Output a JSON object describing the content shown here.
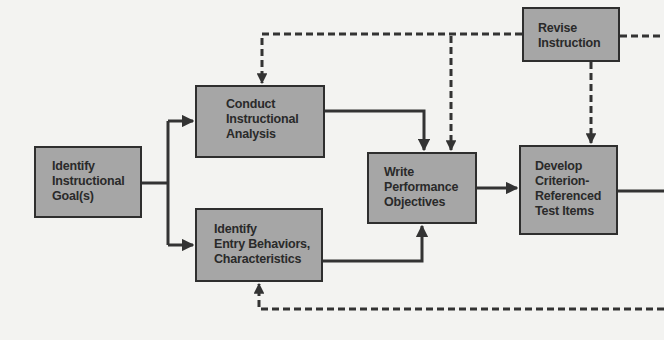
{
  "diagram": {
    "type": "flowchart",
    "colors": {
      "background": "#f3f3f1",
      "box_fill": "#a6a6a6",
      "box_border": "#2e2e2e",
      "line": "#333333",
      "text": "#2a2a2a"
    },
    "nodes": [
      {
        "id": "identify-goals",
        "label": "Identify\nInstructional\nGoal(s)"
      },
      {
        "id": "conduct-analysis",
        "label": "Conduct\nInstructional\nAnalysis"
      },
      {
        "id": "identify-entry",
        "label": "Identify\nEntry Behaviors,\nCharacteristics"
      },
      {
        "id": "write-objectives",
        "label": "Write\nPerformance\nObjectives"
      },
      {
        "id": "develop-test-items",
        "label": "Develop\nCriterion-\nReferenced\nTest Items"
      },
      {
        "id": "revise-instruction",
        "label": "Revise\nInstruction"
      }
    ],
    "edges": [
      {
        "from": "identify-goals",
        "to": "conduct-analysis",
        "style": "solid"
      },
      {
        "from": "identify-goals",
        "to": "identify-entry",
        "style": "solid"
      },
      {
        "from": "conduct-analysis",
        "to": "write-objectives",
        "style": "solid"
      },
      {
        "from": "identify-entry",
        "to": "write-objectives",
        "style": "solid"
      },
      {
        "from": "write-objectives",
        "to": "develop-test-items",
        "style": "solid"
      },
      {
        "from": "develop-test-items",
        "to": "off-canvas-right",
        "style": "solid"
      },
      {
        "from": "revise-instruction",
        "to": "conduct-analysis",
        "style": "dashed"
      },
      {
        "from": "revise-instruction",
        "to": "write-objectives",
        "style": "dashed"
      },
      {
        "from": "revise-instruction",
        "to": "develop-test-items",
        "style": "dashed"
      },
      {
        "from": "off-canvas-right",
        "to": "revise-instruction",
        "style": "dashed"
      },
      {
        "from": "off-canvas-right",
        "to": "identify-entry",
        "style": "dashed"
      }
    ]
  }
}
